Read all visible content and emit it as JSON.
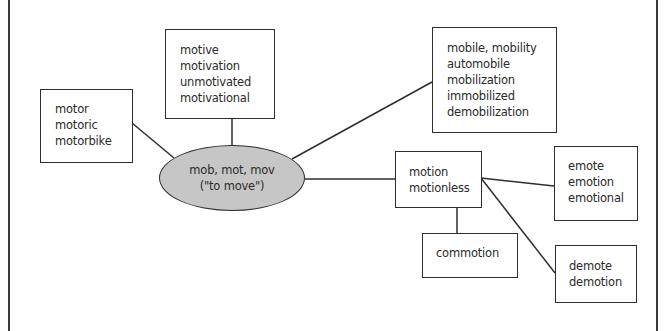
{
  "diagram": {
    "type": "word-family-web",
    "root": {
      "lines": [
        "mob, mot, mov",
        "(\"to move\")"
      ],
      "fill": "#c6c6c6"
    },
    "nodes": {
      "motor": {
        "words": [
          "motor",
          "motoric",
          "motorbike"
        ]
      },
      "motive": {
        "words": [
          "motive",
          "motivation",
          "unmotivated",
          "motivational"
        ]
      },
      "mobile": {
        "words": [
          "mobile, mobility",
          "automobile",
          "mobilization",
          "immobilized",
          "demobilization"
        ]
      },
      "motion": {
        "words": [
          "motion",
          "motionless"
        ]
      },
      "commotion": {
        "words": [
          "commotion"
        ]
      },
      "emote": {
        "words": [
          "emote",
          "emotion",
          "emotional"
        ]
      },
      "demote": {
        "words": [
          "demote",
          "demotion"
        ]
      }
    },
    "edges": [
      {
        "from": "root",
        "to": "motor"
      },
      {
        "from": "root",
        "to": "motive"
      },
      {
        "from": "root",
        "to": "mobile"
      },
      {
        "from": "root",
        "to": "motion"
      },
      {
        "from": "motion",
        "to": "commotion"
      },
      {
        "from": "motion",
        "to": "emote"
      },
      {
        "from": "motion",
        "to": "demote"
      }
    ],
    "colors": {
      "line": "#2e2e2e",
      "root_fill": "#c6c6c6",
      "box_fill": "#ffffff"
    }
  }
}
